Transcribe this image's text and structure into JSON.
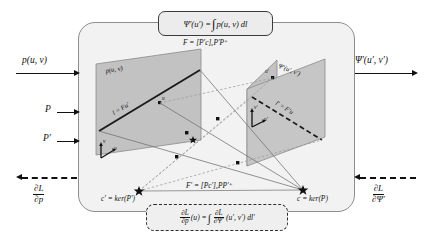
{
  "figure": {
    "title_equation": "forward-projection-integral",
    "domain": "epipolar-geometry-differentiable-projection"
  },
  "top_box": {
    "lhs": "Ψ′(u′) =",
    "integral": "∫",
    "integrand": "p(u, v) dl"
  },
  "bottom_box": {
    "num_left": "∂L",
    "den_left": "∂p",
    "arg_left": "(u) =",
    "integral": "∫",
    "num_right": "∂L",
    "den_right": "∂Ψ′",
    "arg_right": "(u′, v′) dl′"
  },
  "left_inputs": {
    "signal": "p(u, v)",
    "proj1": "P",
    "proj2": "P′",
    "grad_num": "∂L",
    "grad_den": "∂p"
  },
  "right_outputs": {
    "signal": "Ψ′(u′, v′)",
    "grad_num": "∂L",
    "grad_den": "∂Ψ′"
  },
  "fundamental": {
    "f_forward": "F = [P′c]ₓP′P⁺",
    "f_backward": "F′ = [Pc′]ₓPP′⁺"
  },
  "planes": {
    "left": {
      "label": "p(u, v)",
      "line_label": "l = Fu′",
      "point_label": "u",
      "axis_v": "v",
      "axis_u": "u"
    },
    "right": {
      "label": "Ψ′(u′, v′)",
      "line_label": "l′ = F′u",
      "point_label": "u′",
      "axis_v": "v′",
      "axis_u": "u′"
    }
  },
  "centers": {
    "left": "c′ = ker(P′)",
    "right": "c = ker(P)"
  },
  "colors": {
    "panel_bg": "#f2f2f2",
    "panel_border": "#8d8d8d",
    "plane_fill": "#bdbdbd",
    "box_border": "#3b3b3b",
    "ink": "#111111",
    "ray_solid": "#6f6f6f",
    "ray_dashed": "#9a9a9a"
  }
}
